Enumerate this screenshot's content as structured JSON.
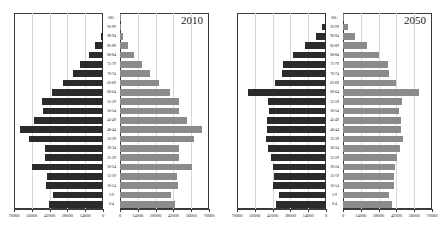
{
  "chart_data": {
    "type": "bar",
    "title": "",
    "subtitle": "",
    "xlabel": "",
    "ylabel": "",
    "grid": true,
    "legend_position": "none",
    "orientation": "horizontal",
    "layout": "population-pyramid-pair",
    "categories": [
      "0-4",
      "5-9",
      "10-14",
      "15-19",
      "20-24",
      "25-29",
      "30-34",
      "35-39",
      "40-44",
      "45-49",
      "50-54",
      "55-59",
      "60-64",
      "65-69",
      "70-74",
      "75-79",
      "80-84",
      "85-89",
      "90-94",
      "95-99",
      "100+"
    ],
    "xlim": [
      -70000,
      70000
    ],
    "xticks": [
      70000,
      56000,
      42000,
      28000,
      14000,
      0
    ],
    "xtick_labels": [
      "70000",
      "56000",
      "42000",
      "28000",
      "14000",
      "0"
    ],
    "panels": [
      {
        "year_label": "2010",
        "series": [
          {
            "name": "male",
            "side": "left",
            "color": "#2b2b2b",
            "values": [
              42500,
              39000,
              44500,
              44000,
              55500,
              45500,
              45500,
              58500,
              65500,
              54000,
              47500,
              48000,
              40000,
              31500,
              24000,
              18000,
              11000,
              6500,
              1800,
              500,
              150
            ]
          },
          {
            "name": "female",
            "side": "right",
            "color": "#8b8b8b",
            "values": [
              43500,
              40500,
              45500,
              45000,
              56500,
              46500,
              46500,
              58500,
              64500,
              53000,
              46500,
              46500,
              39000,
              31000,
              23500,
              17500,
              11000,
              6500,
              2000,
              500,
              150
            ]
          }
        ]
      },
      {
        "year_label": "2050",
        "series": [
          {
            "name": "male",
            "side": "left",
            "color": "#2b2b2b",
            "values": [
              39500,
              37000,
              41500,
              41000,
              42000,
              43500,
              46000,
              47500,
              46500,
              46500,
              45000,
              46000,
              61000,
              40500,
              35000,
              33500,
              26000,
              16500,
              7500,
              3000,
              700
            ]
          },
          {
            "name": "female",
            "side": "right",
            "color": "#8b8b8b",
            "values": [
              38500,
              36000,
              40500,
              40000,
              41000,
              42500,
              45000,
              47000,
              45500,
              45500,
              44000,
              46500,
              60000,
              41500,
              36500,
              35000,
              28000,
              18500,
              9500,
              4000,
              900
            ]
          }
        ]
      }
    ]
  }
}
